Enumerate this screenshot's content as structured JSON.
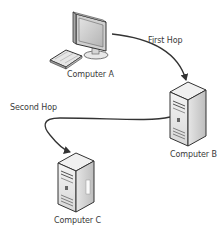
{
  "diagram": {
    "nodes": [
      {
        "id": "computer-a",
        "label": "Computer A",
        "type": "workstation"
      },
      {
        "id": "computer-b",
        "label": "Computer B",
        "type": "server"
      },
      {
        "id": "computer-c",
        "label": "Computer C",
        "type": "server"
      }
    ],
    "edges": [
      {
        "from": "computer-a",
        "to": "computer-b",
        "label": "First Hop"
      },
      {
        "from": "computer-b",
        "to": "computer-c",
        "label": "Second Hop"
      }
    ]
  },
  "colors": {
    "line": "#333333",
    "text": "#3a3a3a",
    "device_light": "#f2f2f2",
    "device_mid": "#d6d6d6",
    "device_dark": "#9a9a9a",
    "screen": "#c8c8c8"
  }
}
